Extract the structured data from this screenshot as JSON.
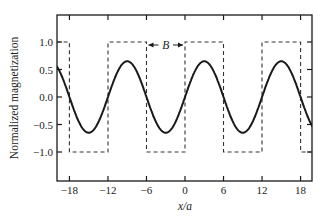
{
  "chart_data": {
    "type": "line",
    "title": "",
    "xlabel": "x/a",
    "ylabel": "Normalized magnetization",
    "xlim": [
      -20,
      20
    ],
    "ylim": [
      -1.5,
      1.5
    ],
    "xticks": [
      -18,
      -12,
      -6,
      0,
      6,
      12,
      18
    ],
    "xtick_labels": [
      "−18",
      "−12",
      "−6",
      "0",
      "6",
      "12",
      "18"
    ],
    "yticks": [
      1.0,
      0.5,
      0.0,
      -0.5,
      -1.0
    ],
    "ytick_labels": [
      "1.0",
      "0.5",
      "0.0",
      "−0.5",
      "−1.0"
    ],
    "grid": false,
    "annotation": {
      "text": "B",
      "from_x": -6,
      "to_x": 0,
      "y": 1.0,
      "style": "double-arrow"
    },
    "series": [
      {
        "name": "magnetization (smooth)",
        "style": "solid",
        "color": "#1a1a1a",
        "function": "0.65*cos(2*pi*(x-3)/12)",
        "amplitude": 0.65,
        "period": 12,
        "maxima_x": [
          -9,
          3,
          15
        ],
        "minima_x": [
          -15,
          -3,
          9
        ]
      },
      {
        "name": "square wave",
        "style": "dashed",
        "color": "#333333",
        "x": [
          -20,
          -18,
          -18,
          -12,
          -12,
          -6,
          -6,
          0,
          0,
          6,
          6,
          12,
          12,
          18,
          18,
          20
        ],
        "values": [
          1,
          1,
          -1,
          -1,
          1,
          1,
          -1,
          -1,
          1,
          1,
          -1,
          -1,
          1,
          1,
          -1,
          -1
        ]
      }
    ]
  }
}
